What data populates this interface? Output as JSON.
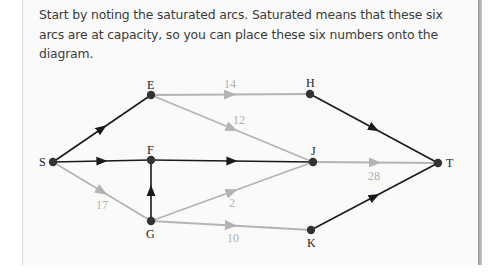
{
  "intro_text": "Start by noting the saturated arcs. Saturated means that these six arcs are at capacity, so you can place these six numbers onto the diagram.",
  "colors": {
    "unsaturated_edge": "#1a1a1a",
    "saturated_edge": "#b4b4b4",
    "node": "#333333",
    "label": "#b0b0b0"
  },
  "nodes": {
    "S": {
      "label": "S"
    },
    "E": {
      "label": "E"
    },
    "F": {
      "label": "F"
    },
    "G": {
      "label": "G"
    },
    "H": {
      "label": "H"
    },
    "J": {
      "label": "J"
    },
    "K": {
      "label": "K"
    },
    "T": {
      "label": "T"
    }
  },
  "edges": {
    "E_H": {
      "from": "E",
      "to": "H",
      "label": "14",
      "saturated": true
    },
    "E_J": {
      "from": "E",
      "to": "J",
      "label": "12",
      "saturated": true
    },
    "J_T": {
      "from": "J",
      "to": "T",
      "label": "28",
      "saturated": true
    },
    "S_G": {
      "from": "S",
      "to": "G",
      "label": "17",
      "saturated": true
    },
    "G_J": {
      "from": "G",
      "to": "J",
      "label": "2",
      "saturated": true
    },
    "G_K": {
      "from": "G",
      "to": "K",
      "label": "10",
      "saturated": true
    },
    "S_E": {
      "from": "S",
      "to": "E",
      "label": "",
      "saturated": false
    },
    "S_F": {
      "from": "S",
      "to": "F",
      "label": "",
      "saturated": false
    },
    "F_J": {
      "from": "F",
      "to": "J",
      "label": "",
      "saturated": false
    },
    "G_F": {
      "from": "G",
      "to": "F",
      "label": "",
      "saturated": false
    },
    "H_T": {
      "from": "H",
      "to": "T",
      "label": "",
      "saturated": false
    },
    "K_T": {
      "from": "K",
      "to": "T",
      "label": "",
      "saturated": false
    }
  }
}
